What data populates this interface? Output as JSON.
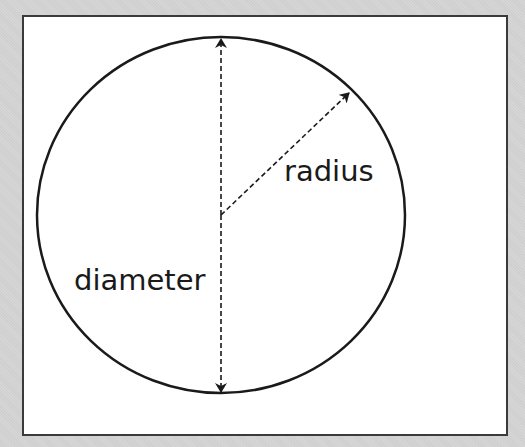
{
  "diagram": {
    "labels": {
      "radius": "radius",
      "diameter": "diameter"
    },
    "colors": {
      "stroke": "#1a1a1a",
      "frame": "#3a3a3a",
      "background": "#d2d2d2",
      "panel": "#ffffff"
    }
  }
}
